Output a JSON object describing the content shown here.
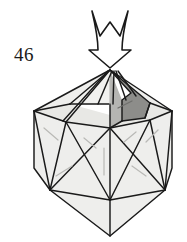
{
  "figure": {
    "step_number": "46",
    "type": "origami-diagram",
    "colors": {
      "background": "#ffffff",
      "ink": "#1a1a1a",
      "face_light": "#eeeeec",
      "face_mid": "#e4e4e1",
      "face_shaded": "#8d8d8a",
      "crease_light": "#b9b9b6",
      "arrow_fill": "#ffffff"
    },
    "arrow": {
      "name": "push-arrow",
      "direction": "down",
      "tip_x": 110,
      "tip_y": 62,
      "top_y": 10,
      "label": "push down"
    },
    "model": {
      "name": "polyhedron",
      "apex_x": 110,
      "apex_y": 70,
      "shape": "icosahedral-ball",
      "shaded_face_label": "shaded-face"
    }
  }
}
